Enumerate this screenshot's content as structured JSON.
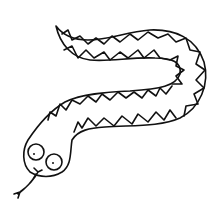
{
  "image": {
    "subject": "snake line drawing",
    "width": 218,
    "height": 218,
    "background": "#ffffff",
    "stroke_color": "#111111"
  }
}
